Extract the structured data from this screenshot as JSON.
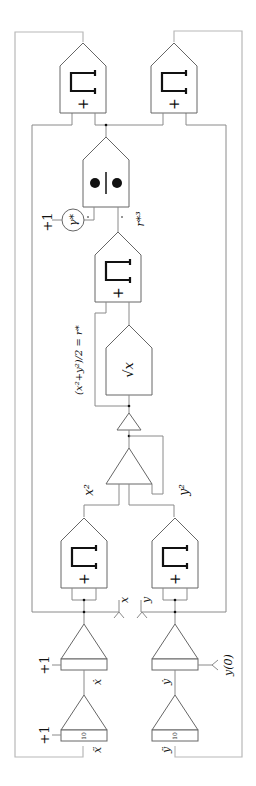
{
  "diagram": {
    "labels": {
      "x_ddot": "ẍ",
      "y_ddot": "ÿ",
      "x_dot": "ẋ",
      "y_dot": "ẏ",
      "x": "x",
      "y": "y",
      "x_sq": "x²",
      "y_sq": "y²",
      "r_star_eq": "(x²+y²)/2 = r*",
      "r_star_cubed": "r*³",
      "gamma_star": "γ*",
      "y_initial": "y(0)",
      "plus_one_a": "+1",
      "plus_one_b": "+1",
      "plus_one_c": "+1",
      "gain_10_a": "10",
      "gain_10_b": "10",
      "sqrt": "√x",
      "mult_plus": "+",
      "div_symbol": "●|●"
    },
    "blocks": [
      {
        "id": "mult-top-left",
        "type": "multiplier"
      },
      {
        "id": "mult-top-right",
        "type": "multiplier"
      },
      {
        "id": "divider",
        "type": "divider"
      },
      {
        "id": "coef-gamma",
        "type": "coefficient-potentiometer"
      },
      {
        "id": "mult-r-cubed",
        "type": "multiplier"
      },
      {
        "id": "sqrt-function",
        "type": "function-generator"
      },
      {
        "id": "inverter",
        "type": "inverter"
      },
      {
        "id": "summer",
        "type": "summer"
      },
      {
        "id": "mult-x-squared",
        "type": "multiplier"
      },
      {
        "id": "mult-y-squared",
        "type": "multiplier"
      },
      {
        "id": "integrator-x",
        "type": "integrator"
      },
      {
        "id": "integrator-x-dot",
        "type": "integrator"
      },
      {
        "id": "integrator-y",
        "type": "integrator"
      },
      {
        "id": "integrator-y-dot",
        "type": "integrator"
      }
    ]
  }
}
